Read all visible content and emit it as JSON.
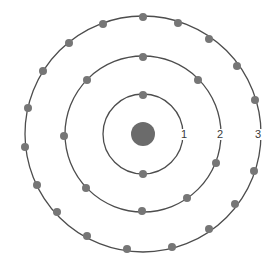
{
  "diagram": {
    "type": "bohr-atom-model",
    "colors": {
      "shell": "#4d4d4d",
      "electron": "#767676",
      "nucleus": "#6b6b6b",
      "background": "#ffffff"
    },
    "center": [
      143,
      134
    ],
    "nucleus": {
      "radius": 12
    },
    "electron_radius": 4,
    "shells": [
      {
        "label": "1",
        "radius": 40,
        "label_pos": [
          184,
          138
        ],
        "electron_count": 2,
        "electrons": [
          [
            143,
            95
          ],
          [
            143,
            174
          ]
        ]
      },
      {
        "label": "2",
        "radius": 78,
        "label_pos": [
          220,
          138
        ],
        "electron_count": 8,
        "electrons": [
          [
            143,
            57
          ],
          [
            198,
            80
          ],
          [
            216,
            163
          ],
          [
            187,
            198
          ],
          [
            142,
            211
          ],
          [
            86,
            188
          ],
          [
            64,
            136
          ],
          [
            87,
            80
          ]
        ]
      },
      {
        "label": "3",
        "radius": 118,
        "label_pos": [
          258,
          138
        ],
        "electron_count": 18,
        "electrons": [
          [
            143,
            17
          ],
          [
            178,
            23
          ],
          [
            209,
            39
          ],
          [
            237,
            66
          ],
          [
            255,
            100
          ],
          [
            254,
            171
          ],
          [
            235,
            204
          ],
          [
            209,
            229
          ],
          [
            172,
            247
          ],
          [
            127,
            249
          ],
          [
            87,
            236
          ],
          [
            57,
            212
          ],
          [
            37,
            185
          ],
          [
            25,
            147
          ],
          [
            28,
            108
          ],
          [
            43,
            71
          ],
          [
            69,
            43
          ],
          [
            103,
            24
          ]
        ]
      }
    ]
  }
}
